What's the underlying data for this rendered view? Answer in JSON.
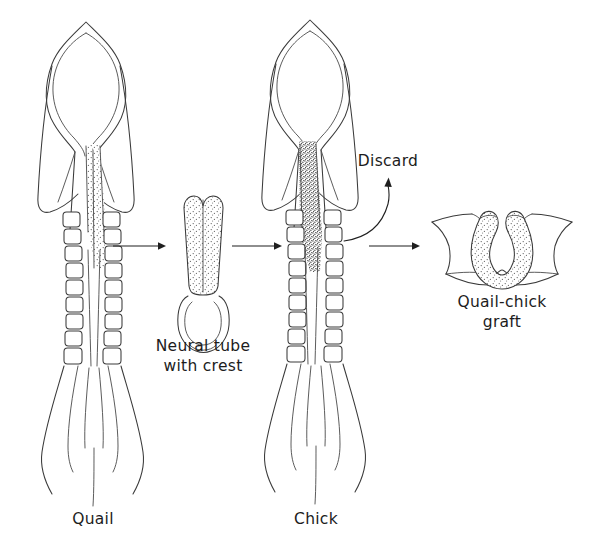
{
  "figure": {
    "background_color": "#ffffff",
    "line_color": "#3a3a3a",
    "text_color": "#1c1c1c",
    "width": 591,
    "height": 544
  },
  "labels": {
    "quail": "Quail",
    "chick": "Chick",
    "neural_tube_line1": "Neural tube",
    "neural_tube_line2": "with crest",
    "discard": "Discard",
    "graft_line1": "Quail-chick",
    "graft_line2": "graft"
  },
  "panels": [
    {
      "id": "quail-embryo",
      "label": "Quail",
      "description": "Dorsal view of quail embryo with pointed head fold, lightly stippled neural tube and ten pairs of somites",
      "somite_pairs": 10,
      "stipple_density": "light"
    },
    {
      "id": "neural-tube-explant",
      "label": "Neural tube with crest",
      "description": "Isolated stippled neural tube with neural crest, bilobed at top and ring-shaped at base",
      "stipple_density": "light"
    },
    {
      "id": "chick-embryo",
      "label": "Chick",
      "description": "Dorsal view of chick embryo with densely stippled neural tube region and ten pairs of somites",
      "somite_pairs": 10,
      "stipple_density": "dense"
    },
    {
      "id": "graft-result",
      "label": "Quail-chick graft",
      "description": "Transverse section showing U-shaped stippled quail neural tube grafted into chick host tissue",
      "stipple_density": "light"
    }
  ],
  "arrows": [
    {
      "id": "arrow-quail-to-tube",
      "type": "straight",
      "direction": "right"
    },
    {
      "id": "arrow-tube-to-chick",
      "type": "straight",
      "direction": "right"
    },
    {
      "id": "arrow-chick-to-graft",
      "type": "straight",
      "direction": "right"
    },
    {
      "id": "arrow-discard",
      "type": "curved",
      "direction": "up-right",
      "label": "Discard"
    }
  ]
}
